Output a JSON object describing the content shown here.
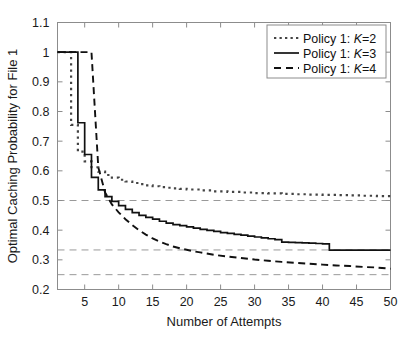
{
  "chart_data": {
    "type": "line",
    "title": "",
    "xlabel": "Number of Attempts",
    "ylabel": "Optimal Caching Probability for File 1",
    "xlim": [
      1,
      50
    ],
    "ylim": [
      0.2,
      1.1
    ],
    "xticks": [
      5,
      10,
      15,
      20,
      25,
      30,
      35,
      40,
      45,
      50
    ],
    "yticks": [
      0.2,
      0.3,
      0.4,
      0.5,
      0.6,
      0.7,
      0.8,
      0.9,
      1,
      1.1
    ],
    "xtick_labels": [
      "5",
      "10",
      "15",
      "20",
      "25",
      "30",
      "35",
      "40",
      "45",
      "50"
    ],
    "ytick_labels": [
      "0.2",
      "0.3",
      "0.4",
      "0.5",
      "0.6",
      "0.7",
      "0.8",
      "0.9",
      "1",
      "1.1"
    ],
    "grid": false,
    "legend_position": "top-right",
    "reference_lines": [
      {
        "name": "one-half",
        "y": 0.5,
        "style": "dashed",
        "color": "#999999"
      },
      {
        "name": "one-third",
        "y": 0.3333,
        "style": "dashed",
        "color": "#999999"
      },
      {
        "name": "one-quarter",
        "y": 0.25,
        "style": "dashed",
        "color": "#999999"
      }
    ],
    "series": [
      {
        "name": "Policy 1: K=2",
        "legend_prefix": "Policy 1: ",
        "legend_var": "K",
        "legend_suffix": "=2",
        "style": "dotted",
        "color": "#444444",
        "step": true,
        "x": [
          1,
          2,
          3,
          4,
          5,
          6,
          7,
          8,
          9,
          10,
          11,
          12,
          13,
          14,
          15,
          16,
          17,
          18,
          19,
          20,
          22,
          24,
          26,
          28,
          30,
          32,
          34,
          36,
          38,
          40,
          42,
          44,
          46,
          48,
          50
        ],
        "y": [
          1.0,
          1.0,
          0.755,
          0.665,
          0.632,
          0.612,
          0.597,
          0.586,
          0.577,
          0.57,
          0.564,
          0.559,
          0.555,
          0.551,
          0.548,
          0.545,
          0.543,
          0.541,
          0.539,
          0.537,
          0.534,
          0.531,
          0.529,
          0.527,
          0.525,
          0.524,
          0.522,
          0.521,
          0.52,
          0.519,
          0.518,
          0.517,
          0.516,
          0.515,
          0.512
        ]
      },
      {
        "name": "Policy 1: K=3",
        "legend_prefix": "Policy 1: ",
        "legend_var": "K",
        "legend_suffix": "=3",
        "style": "solid",
        "color": "#111111",
        "step": true,
        "x": [
          1,
          2,
          3,
          4,
          5,
          6,
          7,
          8,
          9,
          10,
          11,
          12,
          13,
          14,
          15,
          16,
          17,
          18,
          19,
          20,
          21,
          22,
          23,
          24,
          25,
          26,
          27,
          28,
          29,
          30,
          31,
          32,
          33,
          34,
          35,
          36,
          37,
          38,
          39,
          40,
          41,
          45,
          50
        ],
        "y": [
          1.0,
          1.0,
          1.0,
          0.762,
          0.655,
          0.578,
          0.536,
          0.513,
          0.497,
          0.483,
          0.47,
          0.459,
          0.45,
          0.443,
          0.437,
          0.43,
          0.424,
          0.419,
          0.415,
          0.411,
          0.407,
          0.403,
          0.399,
          0.396,
          0.392,
          0.389,
          0.386,
          0.383,
          0.38,
          0.377,
          0.374,
          0.371,
          0.368,
          0.36,
          0.359,
          0.358,
          0.357,
          0.356,
          0.355,
          0.354,
          0.333,
          0.333,
          0.333
        ]
      },
      {
        "name": "Policy 1: K=4",
        "legend_prefix": "Policy 1: ",
        "legend_var": "K",
        "legend_suffix": "=4",
        "style": "dashed",
        "color": "#111111",
        "step": false,
        "x": [
          1,
          2,
          3,
          4,
          5,
          6,
          7,
          8,
          9,
          10,
          11,
          12,
          13,
          14,
          15,
          16,
          17,
          18,
          19,
          20,
          21,
          22,
          24,
          26,
          28,
          30,
          32,
          34,
          36,
          38,
          40,
          42,
          44,
          46,
          48,
          50
        ],
        "y": [
          1.0,
          1.0,
          1.0,
          1.0,
          1.0,
          1.0,
          0.612,
          0.527,
          0.487,
          0.46,
          0.437,
          0.417,
          0.4,
          0.385,
          0.372,
          0.362,
          0.353,
          0.345,
          0.339,
          0.334,
          0.329,
          0.325,
          0.317,
          0.311,
          0.306,
          0.301,
          0.297,
          0.293,
          0.29,
          0.287,
          0.284,
          0.281,
          0.279,
          0.276,
          0.274,
          0.27
        ]
      }
    ]
  },
  "figure": {
    "background": "#ffffff",
    "axis_color": "#808080",
    "reference_line_color": "#999999"
  }
}
